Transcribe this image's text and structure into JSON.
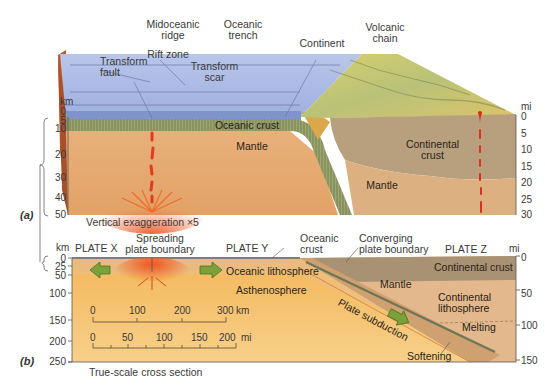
{
  "panel_a": {
    "label": "(a)",
    "labels": {
      "midoceanic_ridge": "Midoceanic ridge",
      "midoceanic_ridge_l1": "Midoceanic",
      "midoceanic_ridge_l2": "ridge",
      "oceanic_trench_l1": "Oceanic",
      "oceanic_trench_l2": "trench",
      "continent": "Continent",
      "volcanic_chain_l1": "Volcanic",
      "volcanic_chain_l2": "chain",
      "rift_zone": "Rift zone",
      "transform_fault_l1": "Transform",
      "transform_fault_l2": "fault",
      "transform_scar_l1": "Transform",
      "transform_scar_l2": "scar",
      "oceanic_crust": "Oceanic crust",
      "mantle_left": "Mantle",
      "continental_crust_l1": "Continental",
      "continental_crust_l2": "crust",
      "mantle_right": "Mantle",
      "vertical_exaggeration": "Vertical exaggeration ×5"
    },
    "left_axis": {
      "unit": "km",
      "ticks": [
        "0",
        "5",
        "10",
        "20",
        "30",
        "40",
        "50"
      ]
    },
    "right_axis": {
      "unit": "mi",
      "ticks": [
        "0",
        "5",
        "10",
        "15",
        "20",
        "25",
        "30"
      ]
    }
  },
  "panel_b": {
    "label": "(b)",
    "labels": {
      "plate_x": "PLATE X",
      "spreading_l1": "Spreading",
      "spreading_l2": "plate boundary",
      "plate_y": "PLATE Y",
      "oceanic_crust_l1": "Oceanic",
      "oceanic_crust_l2": "crust",
      "converging_l1": "Converging",
      "converging_l2": "plate boundary",
      "plate_z": "PLATE Z",
      "oceanic_lithosphere": "Oceanic lithosphere",
      "asthenosphere": "Asthenosphere",
      "continental_crust": "Continental crust",
      "mantle": "Mantle",
      "continental_lithosphere_l1": "Continental",
      "continental_lithosphere_l2": "lithosphere",
      "plate_subduction": "Plate subduction",
      "melting": "Melting",
      "softening": "Softening",
      "caption": "True-scale cross section"
    },
    "left_axis": {
      "unit": "km",
      "ticks": [
        "0",
        "25",
        "50",
        "100",
        "150",
        "200",
        "250"
      ]
    },
    "right_axis": {
      "unit": "mi",
      "ticks": [
        "0",
        "50",
        "100",
        "150"
      ]
    },
    "scale_bar_km": {
      "ticks": [
        "0",
        "100",
        "200",
        "300"
      ],
      "unit": "km"
    },
    "scale_bar_mi": {
      "ticks": [
        "0",
        "50",
        "100",
        "150",
        "200"
      ],
      "unit": "mi"
    }
  },
  "colors": {
    "ocean": "#a9b8e3",
    "ocean_side": "#7f93cc",
    "continent_top": "#d9cc6a",
    "continental_crust": "#b7a07e",
    "mantle": "#e5a96f",
    "oceanic_crust": "#8f9966",
    "magma": "#e8442a",
    "arrow": "#7aa23a",
    "asthenosphere": "#f1b35a"
  }
}
